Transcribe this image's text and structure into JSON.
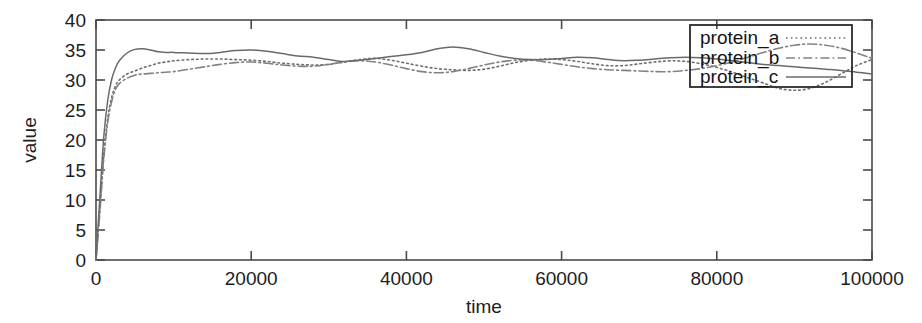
{
  "chart_data": {
    "type": "line",
    "title": "",
    "xlabel": "time",
    "ylabel": "value",
    "xlim": [
      0,
      100000
    ],
    "ylim": [
      0,
      40
    ],
    "grid": false,
    "legend_position": "top-right",
    "xticks": [
      0,
      20000,
      40000,
      60000,
      80000,
      100000
    ],
    "xtick_labels": [
      "0",
      "20000",
      "40000",
      "60000",
      "80000",
      "100000"
    ],
    "yticks": [
      0,
      5,
      10,
      15,
      20,
      25,
      30,
      35,
      40
    ],
    "ytick_labels": [
      "0",
      "5",
      "10",
      "15",
      "20",
      "25",
      "30",
      "35",
      "40"
    ],
    "series": [
      {
        "name": "protein_a",
        "style": "dotted",
        "color": "#6e6e6e",
        "x": [
          0,
          500,
          1000,
          1500,
          2000,
          2500,
          3000,
          4000,
          5000,
          6000,
          7000,
          8000,
          9000,
          10000,
          12000,
          14000,
          16000,
          18000,
          20000,
          22000,
          24000,
          26000,
          28000,
          30000,
          32000,
          34000,
          36000,
          38000,
          40000,
          42000,
          44000,
          46000,
          48000,
          50000,
          52000,
          54000,
          56000,
          58000,
          60000,
          62000,
          64000,
          66000,
          68000,
          70000,
          72000,
          74000,
          76000,
          78000,
          80000,
          82000,
          84000,
          86000,
          88000,
          90000,
          92000,
          94000,
          96000,
          98000,
          100000
        ],
        "y": [
          0,
          8.5,
          17.5,
          23.5,
          27.0,
          29.0,
          30.0,
          31.0,
          31.5,
          32.0,
          32.4,
          32.8,
          33.0,
          33.2,
          33.4,
          33.5,
          33.5,
          33.4,
          33.3,
          33.1,
          32.8,
          32.6,
          32.5,
          32.6,
          33.0,
          33.4,
          33.6,
          33.3,
          32.8,
          32.3,
          31.9,
          31.7,
          31.6,
          31.8,
          32.3,
          32.9,
          33.3,
          33.5,
          33.4,
          33.1,
          32.7,
          32.4,
          32.4,
          32.7,
          33.0,
          33.2,
          33.1,
          32.7,
          32.1,
          31.3,
          30.4,
          29.5,
          28.6,
          28.3,
          28.6,
          29.6,
          31.0,
          32.4,
          33.4
        ]
      },
      {
        "name": "protein_b",
        "style": "dash-dot",
        "color": "#828282",
        "x": [
          0,
          500,
          1000,
          1500,
          2000,
          2500,
          3000,
          4000,
          5000,
          6000,
          7000,
          8000,
          9000,
          10000,
          12000,
          14000,
          16000,
          18000,
          20000,
          22000,
          24000,
          26000,
          28000,
          30000,
          32000,
          34000,
          36000,
          38000,
          40000,
          42000,
          44000,
          46000,
          48000,
          50000,
          52000,
          54000,
          56000,
          58000,
          60000,
          62000,
          64000,
          66000,
          68000,
          70000,
          72000,
          74000,
          76000,
          78000,
          80000,
          82000,
          84000,
          86000,
          88000,
          90000,
          92000,
          94000,
          96000,
          98000,
          100000
        ],
        "y": [
          0,
          8.0,
          16.8,
          22.8,
          26.3,
          28.4,
          29.4,
          30.3,
          30.8,
          31.0,
          31.1,
          31.2,
          31.3,
          31.4,
          31.8,
          32.2,
          32.6,
          32.9,
          33.0,
          32.8,
          32.5,
          32.3,
          32.3,
          32.6,
          33.0,
          33.2,
          33.0,
          32.5,
          31.9,
          31.4,
          31.2,
          31.4,
          31.9,
          32.5,
          33.0,
          33.3,
          33.3,
          33.0,
          32.6,
          32.2,
          31.9,
          31.7,
          31.6,
          31.5,
          31.4,
          31.4,
          31.6,
          31.9,
          32.4,
          33.0,
          33.8,
          34.6,
          35.3,
          35.8,
          36.0,
          35.8,
          35.3,
          34.5,
          33.6
        ]
      },
      {
        "name": "protein_c",
        "style": "solid",
        "color": "#6a6a6a",
        "x": [
          0,
          500,
          1000,
          1500,
          2000,
          2500,
          3000,
          4000,
          5000,
          6000,
          7000,
          8000,
          9000,
          10000,
          12000,
          14000,
          16000,
          18000,
          20000,
          22000,
          24000,
          26000,
          28000,
          30000,
          32000,
          34000,
          36000,
          38000,
          40000,
          42000,
          44000,
          46000,
          48000,
          50000,
          52000,
          54000,
          56000,
          58000,
          60000,
          62000,
          64000,
          66000,
          68000,
          70000,
          72000,
          74000,
          76000,
          78000,
          80000,
          82000,
          84000,
          86000,
          88000,
          90000,
          92000,
          94000,
          96000,
          98000,
          100000
        ],
        "y": [
          0,
          10.5,
          20.5,
          26.5,
          30.0,
          32.0,
          33.2,
          34.5,
          35.1,
          35.2,
          35.0,
          34.7,
          34.6,
          34.6,
          34.5,
          34.4,
          34.6,
          34.9,
          35.0,
          34.8,
          34.4,
          34.0,
          33.8,
          33.4,
          33.1,
          33.3,
          33.6,
          33.9,
          34.2,
          34.6,
          35.2,
          35.5,
          35.2,
          34.6,
          34.0,
          33.6,
          33.4,
          33.4,
          33.6,
          33.8,
          33.7,
          33.4,
          33.2,
          33.3,
          33.5,
          33.7,
          33.8,
          33.7,
          33.5,
          33.2,
          32.9,
          32.6,
          32.4,
          32.2,
          32.0,
          31.8,
          31.6,
          31.3,
          31.0
        ]
      }
    ]
  },
  "legend": {
    "entries": [
      {
        "label": "protein_a"
      },
      {
        "label": "protein_b"
      },
      {
        "label": "protein_c"
      }
    ]
  }
}
